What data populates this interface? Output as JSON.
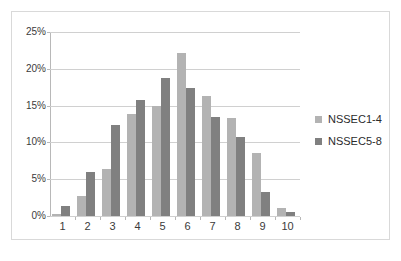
{
  "chart_data": {
    "type": "bar",
    "title": "",
    "subtitle": "",
    "xlabel": "",
    "ylabel": "",
    "categories": [
      "1",
      "2",
      "3",
      "4",
      "5",
      "6",
      "7",
      "8",
      "9",
      "10"
    ],
    "series": [
      {
        "name": "NSSEC1-4",
        "color": "#b3b3b3",
        "values": [
          0.3,
          2.7,
          6.4,
          13.9,
          15.0,
          22.2,
          16.3,
          13.3,
          8.6,
          1.1
        ]
      },
      {
        "name": "NSSEC5-8",
        "color": "#808080",
        "values": [
          1.3,
          6.0,
          12.3,
          15.8,
          18.8,
          17.4,
          13.5,
          10.8,
          3.3,
          0.5
        ]
      }
    ],
    "ylim": [
      0,
      25
    ],
    "yticks": [
      0,
      5,
      10,
      15,
      20,
      25
    ],
    "ytick_labels": [
      "0%",
      "5%",
      "10%",
      "15%",
      "20%",
      "25%"
    ],
    "grid": "horizontal",
    "legend_position": "right",
    "value_suffix": "%"
  },
  "legend": {
    "entries": [
      {
        "label": "NSSEC1-4"
      },
      {
        "label": "NSSEC5-8"
      }
    ]
  },
  "frame": {
    "border_color": "#d9d9d9",
    "background": "#ffffff"
  }
}
